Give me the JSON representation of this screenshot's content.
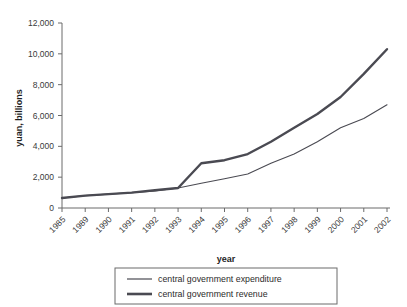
{
  "chart_data": {
    "type": "line",
    "title": "",
    "xlabel": "year",
    "ylabel": "yuan, billions",
    "x": [
      "1985",
      "1989",
      "1990",
      "1991",
      "1992",
      "1993",
      "1994",
      "1995",
      "1996",
      "1997",
      "1998",
      "1999",
      "2000",
      "2001",
      "2002"
    ],
    "categories": [
      "1985",
      "1989",
      "1990",
      "1991",
      "1992",
      "1993",
      "1994",
      "1995",
      "1996",
      "1997",
      "1998",
      "1999",
      "2000",
      "2001",
      "2002"
    ],
    "xlim": [
      0,
      14
    ],
    "ylim": [
      0,
      12000
    ],
    "yticks": [
      0,
      2000,
      4000,
      6000,
      8000,
      10000,
      12000
    ],
    "ytick_labels": [
      "0",
      "2,000",
      "4,000",
      "6,000",
      "8,000",
      "10,000",
      "12,000"
    ],
    "grid": false,
    "legend_position": "bottom-center",
    "series": [
      {
        "name": "central government expenditure",
        "line_width": "thin",
        "color": "#4a4a52",
        "values": [
          650,
          800,
          900,
          1000,
          1100,
          1300,
          1600,
          1900,
          2200,
          2900,
          3500,
          4300,
          5200,
          5800,
          6700
        ]
      },
      {
        "name": "central government revenue",
        "line_width": "thick",
        "color": "#4a4a52",
        "values": [
          650,
          800,
          900,
          1000,
          1150,
          1300,
          2900,
          3100,
          3500,
          4300,
          5200,
          6100,
          7200,
          8700,
          10300
        ]
      }
    ]
  },
  "legend": {
    "items": [
      {
        "label": "central government expenditure"
      },
      {
        "label": "central government revenue"
      }
    ]
  },
  "axes": {
    "y_title": "yuan, billions",
    "x_title": "year"
  }
}
